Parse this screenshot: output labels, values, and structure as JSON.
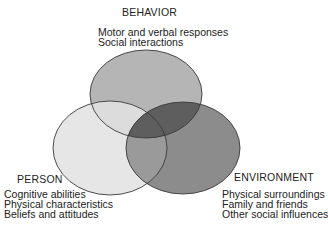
{
  "diagram": {
    "type": "venn",
    "sets": [
      {
        "id": "behavior",
        "title": "BEHAVIOR",
        "items": [
          "Motor and verbal responses",
          "Social interactions"
        ],
        "fill": "#b5b5b5"
      },
      {
        "id": "person",
        "title": "PERSON",
        "items": [
          "Cognitive abilities",
          "Physical characteristics",
          "Beliefs and attitudes"
        ],
        "fill": "#e6e6e6"
      },
      {
        "id": "environment",
        "title": "ENVIRONMENT",
        "items": [
          "Physical surroundings",
          "Family and friends",
          "Other social influences"
        ],
        "fill": "#8c8c8c"
      }
    ],
    "colors": {
      "behavior_person_overlap": "#dcdcdc",
      "behavior_environment_overlap": "#5e5e5e",
      "person_environment_overlap": "#9a9a9a",
      "all_three_overlap": "#5e5e5e",
      "outline": "#3a3a3a"
    }
  }
}
